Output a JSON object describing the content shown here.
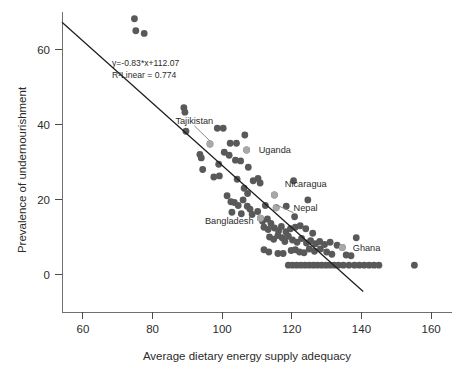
{
  "chart_data": {
    "type": "scatter",
    "title": "",
    "xlabel": "Average dietary energy supply adequacy",
    "ylabel": "Prevalence of undernourishment",
    "xlim": [
      54,
      166
    ],
    "ylim": [
      -6,
      70
    ],
    "xticks": [
      60,
      80,
      100,
      120,
      140,
      160
    ],
    "yticks": [
      0,
      20,
      40,
      60
    ],
    "grid": false,
    "legend": "none",
    "annotations": [
      "y=-0.83*x+112.07",
      "R²Linear = 0.774"
    ],
    "fit_line": {
      "slope": -0.83,
      "intercept": 112.07,
      "r_squared": 0.774,
      "x_start": 54,
      "x_end": 140.5
    },
    "marker_color": "#595959",
    "highlight_color": "#a8a8a8",
    "line_color": "#1d1d1d",
    "labeled_points": [
      {
        "name": "Tajikistan",
        "x": 96.5,
        "y": 34.8,
        "label_x": 92.0,
        "label_y": 41.0,
        "anchor": "middle",
        "leader": true
      },
      {
        "name": "Uganda",
        "x": 107.0,
        "y": 33.2,
        "label_x": 110.5,
        "label_y": 33.2,
        "anchor": "start",
        "leader": false
      },
      {
        "name": "Nicaragua",
        "x": 115.0,
        "y": 21.2,
        "label_x": 118.0,
        "label_y": 24.2,
        "anchor": "start",
        "leader": false
      },
      {
        "name": "Nepal",
        "x": 115.5,
        "y": 17.8,
        "label_x": 120.5,
        "label_y": 17.8,
        "anchor": "start",
        "leader": true
      },
      {
        "name": "Bangladesh",
        "x": 111.0,
        "y": 15.0,
        "label_x": 109.0,
        "label_y": 14.2,
        "anchor": "end",
        "leader": false
      },
      {
        "name": "Ghana",
        "x": 134.5,
        "y": 7.2,
        "label_x": 137.5,
        "label_y": 7.2,
        "anchor": "start",
        "leader": false
      }
    ],
    "points": [
      {
        "x": 74.8,
        "y": 68.2
      },
      {
        "x": 75.2,
        "y": 65.0
      },
      {
        "x": 77.6,
        "y": 64.3
      },
      {
        "x": 89.0,
        "y": 44.5
      },
      {
        "x": 89.3,
        "y": 43.3
      },
      {
        "x": 89.6,
        "y": 38.2
      },
      {
        "x": 98.6,
        "y": 39.0
      },
      {
        "x": 100.3,
        "y": 39.0
      },
      {
        "x": 96.5,
        "y": 34.8
      },
      {
        "x": 102.3,
        "y": 35.0
      },
      {
        "x": 104.1,
        "y": 35.0
      },
      {
        "x": 106.5,
        "y": 37.2
      },
      {
        "x": 93.6,
        "y": 32.0
      },
      {
        "x": 94.0,
        "y": 31.1
      },
      {
        "x": 100.6,
        "y": 32.6
      },
      {
        "x": 102.0,
        "y": 31.8
      },
      {
        "x": 103.8,
        "y": 30.5
      },
      {
        "x": 105.3,
        "y": 30.3
      },
      {
        "x": 107.0,
        "y": 33.2
      },
      {
        "x": 94.4,
        "y": 28.0
      },
      {
        "x": 99.0,
        "y": 29.4
      },
      {
        "x": 107.5,
        "y": 28.6
      },
      {
        "x": 97.6,
        "y": 26.0
      },
      {
        "x": 99.2,
        "y": 26.3
      },
      {
        "x": 104.3,
        "y": 25.4
      },
      {
        "x": 108.9,
        "y": 25.0
      },
      {
        "x": 110.3,
        "y": 25.6
      },
      {
        "x": 110.9,
        "y": 24.4
      },
      {
        "x": 120.5,
        "y": 25.0
      },
      {
        "x": 106.3,
        "y": 23.0
      },
      {
        "x": 107.3,
        "y": 21.6
      },
      {
        "x": 101.4,
        "y": 21.0
      },
      {
        "x": 115.0,
        "y": 21.2
      },
      {
        "x": 102.5,
        "y": 19.4
      },
      {
        "x": 103.5,
        "y": 19.2
      },
      {
        "x": 104.6,
        "y": 18.4
      },
      {
        "x": 106.0,
        "y": 19.9
      },
      {
        "x": 107.2,
        "y": 18.2
      },
      {
        "x": 108.0,
        "y": 17.4
      },
      {
        "x": 112.4,
        "y": 18.4
      },
      {
        "x": 115.5,
        "y": 17.8
      },
      {
        "x": 118.4,
        "y": 18.2
      },
      {
        "x": 124.6,
        "y": 19.9
      },
      {
        "x": 102.8,
        "y": 16.6
      },
      {
        "x": 105.5,
        "y": 16.2
      },
      {
        "x": 108.6,
        "y": 16.0
      },
      {
        "x": 110.2,
        "y": 16.8
      },
      {
        "x": 111.0,
        "y": 15.0
      },
      {
        "x": 111.6,
        "y": 14.2
      },
      {
        "x": 113.0,
        "y": 14.8
      },
      {
        "x": 114.0,
        "y": 13.6
      },
      {
        "x": 120.8,
        "y": 15.4
      },
      {
        "x": 112.0,
        "y": 12.6
      },
      {
        "x": 113.2,
        "y": 12.0
      },
      {
        "x": 115.0,
        "y": 12.4
      },
      {
        "x": 116.2,
        "y": 11.6
      },
      {
        "x": 117.0,
        "y": 12.8
      },
      {
        "x": 118.3,
        "y": 11.4
      },
      {
        "x": 119.6,
        "y": 12.2
      },
      {
        "x": 121.0,
        "y": 12.6
      },
      {
        "x": 122.4,
        "y": 13.0
      },
      {
        "x": 124.0,
        "y": 12.2
      },
      {
        "x": 126.0,
        "y": 11.0
      },
      {
        "x": 113.6,
        "y": 10.0
      },
      {
        "x": 114.8,
        "y": 9.4
      },
      {
        "x": 116.0,
        "y": 10.4
      },
      {
        "x": 117.2,
        "y": 9.8
      },
      {
        "x": 118.0,
        "y": 8.8
      },
      {
        "x": 119.0,
        "y": 10.2
      },
      {
        "x": 120.2,
        "y": 9.2
      },
      {
        "x": 121.5,
        "y": 8.6
      },
      {
        "x": 122.8,
        "y": 9.6
      },
      {
        "x": 124.2,
        "y": 8.4
      },
      {
        "x": 125.4,
        "y": 9.0
      },
      {
        "x": 126.8,
        "y": 8.2
      },
      {
        "x": 128.0,
        "y": 8.8
      },
      {
        "x": 129.4,
        "y": 8.0
      },
      {
        "x": 131.0,
        "y": 8.6
      },
      {
        "x": 133.0,
        "y": 7.8
      },
      {
        "x": 134.5,
        "y": 7.2
      },
      {
        "x": 138.5,
        "y": 9.8
      },
      {
        "x": 112.0,
        "y": 6.6
      },
      {
        "x": 113.4,
        "y": 6.0
      },
      {
        "x": 116.0,
        "y": 5.6
      },
      {
        "x": 117.5,
        "y": 5.6
      },
      {
        "x": 119.8,
        "y": 6.4
      },
      {
        "x": 121.0,
        "y": 6.6
      },
      {
        "x": 122.2,
        "y": 6.0
      },
      {
        "x": 123.5,
        "y": 5.8
      },
      {
        "x": 125.0,
        "y": 6.8
      },
      {
        "x": 126.5,
        "y": 6.2
      },
      {
        "x": 128.2,
        "y": 6.8
      },
      {
        "x": 130.0,
        "y": 6.0
      },
      {
        "x": 131.5,
        "y": 5.4
      },
      {
        "x": 135.6,
        "y": 5.2
      },
      {
        "x": 137.0,
        "y": 5.0
      },
      {
        "x": 119.0,
        "y": 2.5
      },
      {
        "x": 120.2,
        "y": 2.5
      },
      {
        "x": 121.4,
        "y": 2.5
      },
      {
        "x": 122.6,
        "y": 2.5
      },
      {
        "x": 123.8,
        "y": 2.5
      },
      {
        "x": 125.0,
        "y": 2.5
      },
      {
        "x": 126.2,
        "y": 2.5
      },
      {
        "x": 127.4,
        "y": 2.5
      },
      {
        "x": 128.6,
        "y": 2.5
      },
      {
        "x": 129.8,
        "y": 2.5
      },
      {
        "x": 131.0,
        "y": 2.5
      },
      {
        "x": 132.2,
        "y": 2.5
      },
      {
        "x": 133.4,
        "y": 2.5
      },
      {
        "x": 134.8,
        "y": 2.5
      },
      {
        "x": 136.4,
        "y": 2.5
      },
      {
        "x": 138.0,
        "y": 2.5
      },
      {
        "x": 139.4,
        "y": 2.5
      },
      {
        "x": 140.8,
        "y": 2.5
      },
      {
        "x": 142.2,
        "y": 2.5
      },
      {
        "x": 143.6,
        "y": 2.5
      },
      {
        "x": 145.0,
        "y": 2.5
      },
      {
        "x": 155.2,
        "y": 2.5
      }
    ]
  }
}
